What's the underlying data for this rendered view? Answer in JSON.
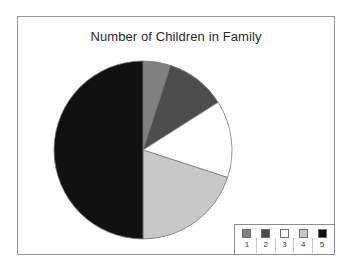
{
  "chart_data": {
    "type": "pie",
    "title": "Number of Children in Family",
    "xlabel": "",
    "ylabel": "",
    "categories": [
      "1",
      "2",
      "3",
      "4",
      "5"
    ],
    "values": [
      5,
      11,
      14,
      20,
      50
    ],
    "units": "percent",
    "start_angle_deg": 0,
    "direction": "clockwise",
    "colors": [
      "#808080",
      "#4d4d4d",
      "#ffffff",
      "#c8c8c8",
      "#111111"
    ],
    "slice_border_color": "#7a7a7a",
    "legend": {
      "position": "bottom-right",
      "entries": [
        {
          "label": "1",
          "color": "#808080"
        },
        {
          "label": "2",
          "color": "#4d4d4d"
        },
        {
          "label": "3",
          "color": "#ffffff"
        },
        {
          "label": "4",
          "color": "#c8c8c8"
        },
        {
          "label": "5",
          "color": "#111111"
        }
      ]
    },
    "grid": false,
    "data_labels": false
  },
  "frame": {
    "border_color": "#9a9a9a"
  }
}
